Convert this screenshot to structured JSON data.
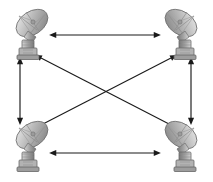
{
  "diagram": {
    "type": "node-link-diagram",
    "canvas": {
      "width": 213,
      "height": 182,
      "background": "#ffffff"
    },
    "node_icon": "satellite-dish-icon",
    "link_style": "double-headed-arrow",
    "link_color": "#1a1a1a",
    "nodes": [
      {
        "id": "tl",
        "label": "",
        "position": "top-left",
        "facing": "right",
        "x": 34,
        "y": 35
      },
      {
        "id": "tr",
        "label": "",
        "position": "top-right",
        "facing": "left",
        "x": 179,
        "y": 35
      },
      {
        "id": "bl",
        "label": "",
        "position": "bottom-left",
        "facing": "right",
        "x": 34,
        "y": 147
      },
      {
        "id": "br",
        "label": "",
        "position": "bottom-right",
        "facing": "left",
        "x": 179,
        "y": 147
      }
    ],
    "links": [
      {
        "id": "top",
        "from": "tl",
        "to": "tr",
        "orientation": "horizontal",
        "x1": 56,
        "y1": 35,
        "x2": 154,
        "y2": 35
      },
      {
        "id": "bottom",
        "from": "bl",
        "to": "br",
        "orientation": "horizontal",
        "x1": 56,
        "y1": 153,
        "x2": 154,
        "y2": 153
      },
      {
        "id": "left",
        "from": "tl",
        "to": "bl",
        "orientation": "vertical",
        "x1": 20,
        "y1": 64,
        "x2": 20,
        "y2": 118
      },
      {
        "id": "right",
        "from": "tr",
        "to": "br",
        "orientation": "vertical",
        "x1": 191,
        "y1": 64,
        "x2": 191,
        "y2": 118
      },
      {
        "id": "diag-nw-se",
        "from": "tl",
        "to": "br",
        "orientation": "diagonal",
        "x1": 41,
        "y1": 58,
        "x2": 171,
        "y2": 125
      },
      {
        "id": "diag-sw-ne",
        "from": "bl",
        "to": "tr",
        "orientation": "diagonal",
        "x1": 41,
        "y1": 125,
        "x2": 171,
        "y2": 58
      }
    ]
  }
}
